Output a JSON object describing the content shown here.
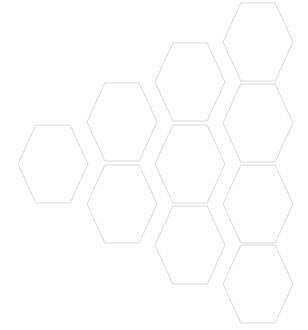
{
  "canvas": {
    "width": 308,
    "height": 330,
    "background_color": "#ffffff",
    "title": "Hexagon honeycomb grid"
  },
  "style": {
    "stroke_color": "#d8d8d8",
    "fill_color": "#ffffff",
    "stroke_width": 1
  },
  "geometry": {
    "orientation": "flat-top",
    "hex_width": 70,
    "hex_height": 78,
    "column_step_x": 68,
    "row_step_y": 81,
    "column_offset_y": 41,
    "gap": 2.5
  },
  "chart_data": {
    "type": "scatter",
    "xlabel": "",
    "ylabel": "",
    "xlim": [
      0,
      308
    ],
    "ylim": [
      0,
      330
    ],
    "grid": false,
    "legend": "none",
    "columns": [
      53,
      122,
      190,
      258
    ],
    "hex_count": 10,
    "hexagons": [
      {
        "id": "hex-c0-r0",
        "col": 0,
        "row": 0,
        "cx": 53,
        "cy": 164,
        "w": 70,
        "h": 78
      },
      {
        "id": "hex-c1-r0",
        "col": 1,
        "row": 0,
        "cx": 122,
        "cy": 122,
        "w": 70,
        "h": 78
      },
      {
        "id": "hex-c1-r1",
        "col": 1,
        "row": 1,
        "cx": 122,
        "cy": 204,
        "w": 70,
        "h": 78
      },
      {
        "id": "hex-c2-r0",
        "col": 2,
        "row": 0,
        "cx": 190,
        "cy": 82,
        "w": 70,
        "h": 78
      },
      {
        "id": "hex-c2-r1",
        "col": 2,
        "row": 1,
        "cx": 190,
        "cy": 164,
        "w": 70,
        "h": 78
      },
      {
        "id": "hex-c2-r2",
        "col": 2,
        "row": 2,
        "cx": 190,
        "cy": 245,
        "w": 70,
        "h": 78
      },
      {
        "id": "hex-c3-r0",
        "col": 3,
        "row": 0,
        "cx": 258,
        "cy": 42,
        "w": 70,
        "h": 78
      },
      {
        "id": "hex-c3-r1",
        "col": 3,
        "row": 1,
        "cx": 258,
        "cy": 123,
        "w": 70,
        "h": 78
      },
      {
        "id": "hex-c3-r2",
        "col": 3,
        "row": 2,
        "cx": 258,
        "cy": 204,
        "w": 70,
        "h": 78
      },
      {
        "id": "hex-c3-r3",
        "col": 3,
        "row": 3,
        "cx": 258,
        "cy": 284,
        "w": 70,
        "h": 78
      }
    ]
  }
}
